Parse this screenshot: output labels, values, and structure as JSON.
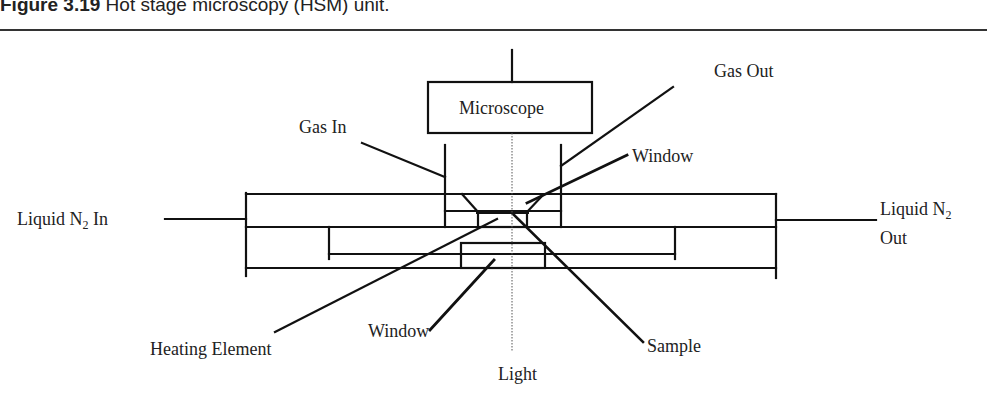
{
  "figure": {
    "number": "Figure 3.19",
    "title": "Hot stage microscopy (HSM) unit."
  },
  "diagram": {
    "labels": {
      "microscope": "Microscope",
      "gas_in": "Gas In",
      "gas_out": "Gas Out",
      "window_top": "Window",
      "liquid_n2_in_prefix": "Liquid N",
      "liquid_n2_in_sub": "2",
      "liquid_n2_in_suffix": " In",
      "liquid_n2_out_prefix": "Liquid N",
      "liquid_n2_out_sub": "2",
      "liquid_n2_out_line2": "Out",
      "heating_element": "Heating Element",
      "window_bottom": "Window",
      "sample": "Sample",
      "light": "Light"
    },
    "colors": {
      "stroke": "#111111",
      "text": "#222222",
      "background": "#ffffff"
    }
  }
}
